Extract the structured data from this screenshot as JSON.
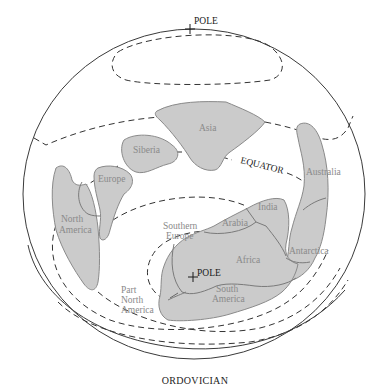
{
  "map": {
    "title": "ORDOVICIAN",
    "north_pole_label": "POLE",
    "south_pole_label": "POLE",
    "equator_label": "EQUATOR",
    "colors": {
      "land_fill": "#cbcbcb",
      "land_border": "#8a8a8a",
      "label_gray": "#8a8a8a",
      "line_dark": "#333333"
    },
    "landmasses": [
      {
        "name": "Asia",
        "label": "Asia"
      },
      {
        "name": "Siberia",
        "label": "Siberia"
      },
      {
        "name": "Europe",
        "label": "Europe"
      },
      {
        "name": "North America",
        "label_line1": "North",
        "label_line2": "America"
      },
      {
        "name": "Australia",
        "label": "Australia"
      },
      {
        "name": "India",
        "label": "India"
      },
      {
        "name": "Arabia",
        "label": "Arabia"
      },
      {
        "name": "Africa",
        "label": "Africa"
      },
      {
        "name": "Antarctica",
        "label": "Antarctica"
      },
      {
        "name": "South America",
        "label_line1": "South",
        "label_line2": "America"
      },
      {
        "name": "Southern Europe",
        "label_line1": "Southern",
        "label_line2": "Europe"
      },
      {
        "name": "Part North America",
        "label_line1": "Part",
        "label_line2": "North",
        "label_line3": "America"
      }
    ]
  }
}
